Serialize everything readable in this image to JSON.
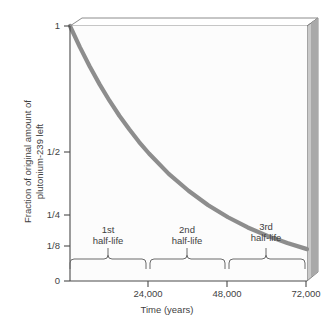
{
  "chart_data": {
    "type": "line",
    "title": "",
    "xlabel": "Time (years)",
    "ylabel": "Fraction of original amount of plutonium-239 left",
    "ylabel_line1": "Fraction of original amount of",
    "ylabel_line2": "plutonium-239 left",
    "xlim": [
      0,
      72000
    ],
    "ylim": [
      0,
      1
    ],
    "grid": false,
    "legend": null,
    "x_ticks": [
      {
        "value": 24000,
        "label": "24,000"
      },
      {
        "value": 48000,
        "label": "48,000"
      },
      {
        "value": 72000,
        "label": "72,000"
      }
    ],
    "y_ticks": [
      {
        "value": 1,
        "label": "1"
      },
      {
        "value": 0.5,
        "label": "1/2"
      },
      {
        "value": 0.25,
        "label": "1/4"
      },
      {
        "value": 0.125,
        "label": "1/8"
      },
      {
        "value": 0,
        "label": "0"
      }
    ],
    "series": [
      {
        "name": "plutonium-239 remaining",
        "color": "#8d8d8d",
        "half_life_years": 24000,
        "x": [
          0,
          3000,
          6000,
          9000,
          12000,
          15000,
          18000,
          21000,
          24000,
          30000,
          36000,
          42000,
          48000,
          54000,
          60000,
          66000,
          72000
        ],
        "y": [
          1.0,
          0.917,
          0.841,
          0.771,
          0.707,
          0.648,
          0.595,
          0.545,
          0.5,
          0.42,
          0.354,
          0.297,
          0.25,
          0.21,
          0.177,
          0.149,
          0.125
        ]
      }
    ],
    "annotations": [
      {
        "name": "first-half-life",
        "line1": "1st",
        "line2": "half-life",
        "x_start": 0,
        "x_end": 24000,
        "x_center": 12000
      },
      {
        "name": "second-half-life",
        "line1": "2nd",
        "line2": "half-life",
        "x_start": 24000,
        "x_end": 48000,
        "x_center": 36000
      },
      {
        "name": "third-half-life",
        "line1": "3rd",
        "line2": "half-life",
        "x_start": 48000,
        "x_end": 72000,
        "x_center": 60000
      }
    ],
    "colors": {
      "curve": "#8d8d8d",
      "axis": "#4a4a4a",
      "brace": "#6a6a6a",
      "plot_background": "#fcfcfc",
      "wall_light": "#d8d8d8",
      "wall_dark": "#9d9d9d",
      "text": "#3f3f3f"
    }
  },
  "axis": {
    "y_tick_1": "1",
    "y_tick_half": "1/2",
    "y_tick_quarter": "1/4",
    "y_tick_eighth": "1/8",
    "y_tick_zero": "0",
    "x_tick_24000": "24,000",
    "x_tick_48000": "48,000",
    "x_tick_72000": "72,000",
    "x_title": "Time (years)",
    "y_title_line1": "Fraction of original amount of",
    "y_title_line2": "plutonium-239 left"
  },
  "braces": {
    "first_line1": "1st",
    "first_line2": "half-life",
    "second_line1": "2nd",
    "second_line2": "half-life",
    "third_line1": "3rd",
    "third_line2": "half-life"
  }
}
